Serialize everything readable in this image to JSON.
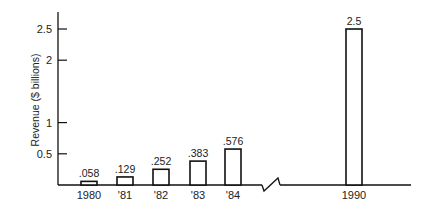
{
  "chart_data": {
    "type": "bar",
    "title": "",
    "xlabel": "",
    "ylabel": "Revenue ($ billions)",
    "categories": [
      "1980",
      "'81",
      "'82",
      "'83",
      "'84",
      "1990"
    ],
    "values": [
      0.058,
      0.129,
      0.252,
      0.383,
      0.576,
      2.5
    ],
    "value_labels": [
      ".058",
      ".129",
      ".252",
      ".383",
      ".576",
      "2.5"
    ],
    "yticks": [
      0.5,
      1,
      2,
      2.5
    ],
    "ytick_labels": [
      "0.5",
      "1",
      "2",
      "2.5"
    ],
    "ylim": [
      0,
      2.7
    ],
    "grid": false,
    "legend": null,
    "annotations": [
      "axis break between '84 and 1990"
    ],
    "bar_style": {
      "fill": "#ffffff",
      "stroke": "#111111"
    }
  }
}
